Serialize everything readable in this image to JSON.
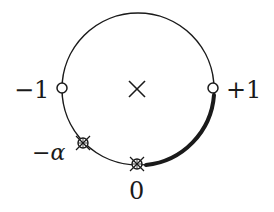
{
  "diagram": {
    "colors": {
      "stroke": "#1a1a1a",
      "background": "#ffffff"
    },
    "circle": {
      "cx": 138,
      "cy": 89,
      "r": 76
    },
    "center_marker": {
      "symbol": "cross",
      "cx": 137,
      "cy": 89
    },
    "points": [
      {
        "id": "minus-one",
        "label": "−1",
        "marker": "open-circle",
        "x": 62,
        "y": 88
      },
      {
        "id": "plus-one",
        "label": "+1",
        "marker": "open-circle",
        "x": 213,
        "y": 88
      },
      {
        "id": "minus-alpha",
        "label": "−α",
        "marker": "crossed-circle-x",
        "x": 83,
        "y": 143
      },
      {
        "id": "zero",
        "label": "0",
        "marker": "crossed-circle-x",
        "x": 137,
        "y": 164
      }
    ],
    "highlighted_arc": {
      "from": "+1",
      "to": "0",
      "style": "thick"
    }
  }
}
